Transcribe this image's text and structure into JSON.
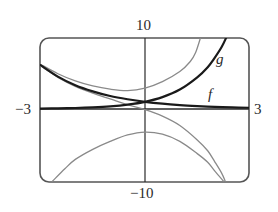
{
  "chart_data": {
    "type": "line",
    "title": "",
    "xlabel": "",
    "ylabel": "",
    "xlim": [
      -3,
      3
    ],
    "ylim": [
      -10,
      10
    ],
    "grid": false,
    "tick_labels": {
      "x_min": "−3",
      "x_max": "3",
      "y_max": "10",
      "y_min": "−10"
    },
    "series": [
      {
        "name": "f",
        "label": "f",
        "color": "#1a1a1a",
        "width": 2.2,
        "points": [
          [
            -3,
            6.1
          ],
          [
            -2.5,
            4.5
          ],
          [
            -2,
            3.3
          ],
          [
            -1.5,
            2.45
          ],
          [
            -1,
            1.8
          ],
          [
            -0.5,
            1.35
          ],
          [
            0,
            1.0
          ],
          [
            0.5,
            0.74
          ],
          [
            1,
            0.55
          ],
          [
            1.5,
            0.41
          ],
          [
            2,
            0.3
          ],
          [
            2.5,
            0.22
          ],
          [
            3,
            0.17
          ]
        ]
      },
      {
        "name": "g",
        "label": "g",
        "color": "#1a1a1a",
        "width": 2.2,
        "points": [
          [
            -3,
            0.05
          ],
          [
            -2.5,
            0.09
          ],
          [
            -2,
            0.14
          ],
          [
            -1.5,
            0.23
          ],
          [
            -1,
            0.37
          ],
          [
            -0.5,
            0.61
          ],
          [
            0,
            1.0
          ],
          [
            0.5,
            1.65
          ],
          [
            1,
            2.7
          ],
          [
            1.5,
            4.4
          ],
          [
            1.8,
            5.8
          ],
          [
            2,
            7.1
          ],
          [
            2.2,
            8.6
          ],
          [
            2.34,
            10
          ]
        ]
      },
      {
        "name": "f + g",
        "label": "",
        "color": "#8a8a8a",
        "width": 1.3,
        "points": [
          [
            -3,
            6.2
          ],
          [
            -2.5,
            4.9
          ],
          [
            -2,
            3.9
          ],
          [
            -1.5,
            3.2
          ],
          [
            -1,
            2.75
          ],
          [
            -0.5,
            2.55
          ],
          [
            0,
            2.9
          ],
          [
            0.5,
            3.8
          ],
          [
            1,
            5.2
          ],
          [
            1.3,
            6.6
          ],
          [
            1.45,
            7.8
          ],
          [
            1.6,
            10
          ]
        ]
      },
      {
        "name": "f - g",
        "label": "",
        "color": "#8a8a8a",
        "width": 1.3,
        "points": [
          [
            -3,
            6.0
          ],
          [
            -2.5,
            4.4
          ],
          [
            -2,
            3.15
          ],
          [
            -1.5,
            2.2
          ],
          [
            -1,
            1.4
          ],
          [
            -0.5,
            0.6
          ],
          [
            0,
            -0.1
          ],
          [
            0.5,
            -1.0
          ],
          [
            1,
            -2.3
          ],
          [
            1.5,
            -4.3
          ],
          [
            1.8,
            -5.8
          ],
          [
            2,
            -7.3
          ],
          [
            2.2,
            -8.9
          ],
          [
            2.3,
            -10
          ]
        ]
      },
      {
        "name": "f · g (inverted)",
        "label": "",
        "color": "#8a8a8a",
        "width": 1.3,
        "points": [
          [
            -2.65,
            -10
          ],
          [
            -2.3,
            -8.3
          ],
          [
            -2,
            -7.0
          ],
          [
            -1.5,
            -5.6
          ],
          [
            -1,
            -4.5
          ],
          [
            -0.5,
            -3.6
          ],
          [
            0,
            -3.2
          ],
          [
            0.5,
            -3.5
          ],
          [
            1,
            -4.5
          ],
          [
            1.5,
            -6.2
          ],
          [
            1.8,
            -7.4
          ],
          [
            2,
            -8.6
          ],
          [
            2.25,
            -10
          ]
        ]
      }
    ],
    "annotations": [
      {
        "text": "g",
        "x": 2.3,
        "y": 7.9
      },
      {
        "text": "f",
        "x": 2.0,
        "y": 1.8
      }
    ]
  },
  "layout": {
    "frame": {
      "left": 40,
      "top": 38,
      "right": 249,
      "bottom": 182,
      "radius": 9
    },
    "origin_px": {
      "x": 145,
      "y": 109
    },
    "frame_color": "#555555",
    "axis_color": "#2a2a2a"
  }
}
